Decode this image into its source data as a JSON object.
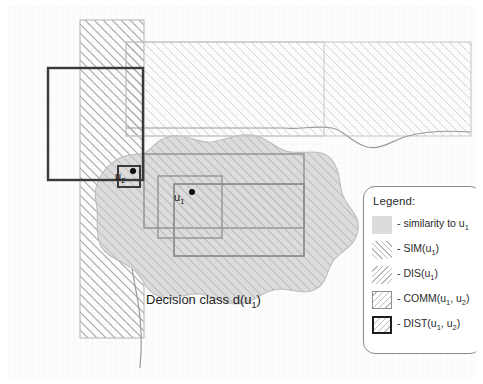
{
  "figure": {
    "decision_class_label": "Decision class d(u",
    "decision_class_sub": "1",
    "decision_class_tail": ")",
    "points": [
      {
        "name": "u2",
        "label": "u",
        "sub": "2",
        "x": 113,
        "y": 170
      },
      {
        "name": "u1",
        "label": "u",
        "sub": "1",
        "x": 172,
        "y": 190
      }
    ]
  },
  "legend": {
    "title": "Legend:",
    "items": [
      {
        "icon": "gray-swatch",
        "swatch": "sw-sim-gray",
        "text": "- similarity to u",
        "sub": "1",
        "tail": ""
      },
      {
        "icon": "sim-hatch",
        "swatch": "sw-sim",
        "text": "- SIM(u",
        "sub": "1",
        "tail": ")"
      },
      {
        "icon": "dis-hatch",
        "swatch": "sw-dis",
        "text": "- DIS(u",
        "sub": "1",
        "tail": ")"
      },
      {
        "icon": "comm-box",
        "swatch": "sw-comm",
        "text": "- COMM(u",
        "sub": "1",
        "tail": ", u",
        "sub2": "2",
        "tail2": ")"
      },
      {
        "icon": "dist-box",
        "swatch": "sw-dist",
        "text": "- DIST(u",
        "sub": "1",
        "tail": ", u",
        "sub2": "2",
        "tail2": ")"
      }
    ]
  },
  "colors": {
    "hatch_light": "#c9c9c9",
    "hatch_mid": "#b0b0b0",
    "blob_fill": "#dcdcdc",
    "comm_border": "#8f8f8f",
    "dist_border": "#1f1f1f",
    "point": "#0b0b0b",
    "curve": "#9a9a9a",
    "background": "#fdfdfd"
  }
}
